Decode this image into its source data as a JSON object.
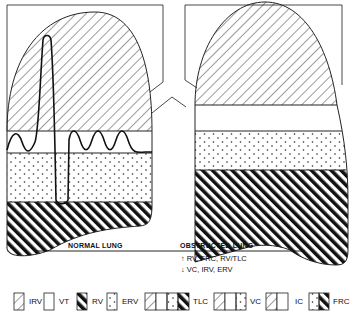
{
  "diagram": {
    "type": "lung volume comparison",
    "lungs": [
      {
        "title": "NORMAL LUNG",
        "bands_top_to_bottom": [
          "IRV",
          "VT",
          "ERV",
          "RV"
        ],
        "spirogram": "tidal breathing waves with one maximal inspiration-expiration spike"
      },
      {
        "title": "OBSTRUCTED LUNG",
        "bands_top_to_bottom": [
          "IRV",
          "VT",
          "ERV",
          "RV"
        ]
      }
    ],
    "changes": {
      "increased_arrow": "↑",
      "increased": "RV, FRC,   RV/TLC",
      "decreased_arrow": "↓",
      "decreased": "VC,   IRV,   ERV"
    },
    "legend": [
      {
        "key": "IRV",
        "pattern": "thin-diagonal-hatch"
      },
      {
        "key": "VT",
        "pattern": "blank"
      },
      {
        "key": "RV",
        "pattern": "thick-diagonal-hatch"
      },
      {
        "key": "ERV",
        "pattern": "dots"
      },
      {
        "key": "TLC",
        "pattern": "thin-hatch + blank + dots + thick-hatch"
      },
      {
        "key": "VC",
        "pattern": "thin-hatch + blank + dots"
      },
      {
        "key": "IC",
        "pattern": "thin-hatch + blank"
      },
      {
        "key": "FRC",
        "pattern": "dots + thick-hatch"
      }
    ],
    "colors": {
      "ink": "#111111",
      "paper": "#ffffff"
    }
  }
}
